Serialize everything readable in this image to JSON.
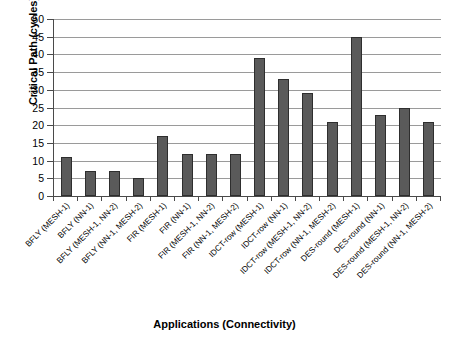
{
  "chart_data": {
    "type": "bar",
    "title": "",
    "xlabel": "Applications (Connectivity)",
    "ylabel": "Critical Path (cycles)",
    "ylim": [
      0,
      50
    ],
    "ytick_step": 5,
    "yticks": [
      "0",
      "5",
      "10",
      "15",
      "20",
      "25",
      "30",
      "35",
      "40",
      "45",
      "50"
    ],
    "grid": true,
    "legend": "none",
    "bar_color": "#5a5a5a",
    "bar_border_color": "#2e2e2e",
    "gridline_color": "#9a9a9a",
    "axis_color": "#4a4a4a",
    "categories": [
      "BFLY (MESH-1)",
      "BFLY (NN-1)",
      "BFLY (MESH-1, NN-2)",
      "BFLY (NN-1, MESH-2)",
      "FIR (MESH-1)",
      "FIR (NN-1)",
      "FIR (MESH-1, NN-2)",
      "FIR (NN-1, MESH-2)",
      "IDCT-row (MESH-1)",
      "IDCT-row (NN-1)",
      "IDCT-row (MESH-1, NN-2)",
      "IDCT-row (NN-1, MESH-2)",
      "DES-round (MESH-1)",
      "DES-round (NN-1)",
      "DES-round (MESH-1, NN-2)",
      "DES-round (NN-1, MESH-2)"
    ],
    "values": [
      11,
      7,
      7,
      5,
      17,
      12,
      12,
      12,
      39,
      33,
      29,
      21,
      45,
      23,
      25,
      21
    ]
  }
}
